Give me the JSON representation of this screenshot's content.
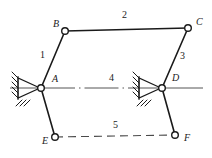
{
  "figure": {
    "width": 212,
    "height": 158,
    "background_color": "#ffffff",
    "line_color": "#1a1a1a",
    "label_color": "#1a1a1a"
  },
  "joints": [
    {
      "id": "A",
      "label": "A",
      "x": 41,
      "y": 88,
      "type": "fixed-pivot",
      "label_x": 52,
      "label_y": 74
    },
    {
      "id": "B",
      "label": "B",
      "x": 65,
      "y": 31,
      "type": "pin",
      "label_x": 53,
      "label_y": 19
    },
    {
      "id": "C",
      "label": "C",
      "x": 188,
      "y": 28,
      "type": "pin",
      "label_x": 196,
      "label_y": 17
    },
    {
      "id": "D",
      "label": "D",
      "x": 162,
      "y": 88,
      "type": "fixed-pivot",
      "label_x": 172,
      "label_y": 73
    },
    {
      "id": "E",
      "label": "E",
      "x": 55,
      "y": 137,
      "type": "pin",
      "label_x": 42,
      "label_y": 136
    },
    {
      "id": "F",
      "label": "F",
      "x": 175,
      "y": 135,
      "type": "pin",
      "label_x": 184,
      "label_y": 133
    }
  ],
  "links": [
    {
      "id": "1",
      "label": "1",
      "from": "A",
      "to": "B",
      "style": "solid",
      "label_x": 40,
      "label_y": 50
    },
    {
      "id": "2",
      "label": "2",
      "from": "B",
      "to": "C",
      "style": "solid",
      "label_x": 122,
      "label_y": 10
    },
    {
      "id": "3",
      "label": "3",
      "from": "C",
      "to": "D",
      "style": "solid",
      "label_x": 180,
      "label_y": 51
    },
    {
      "id": "4",
      "label": "4",
      "from": "A",
      "to": "D",
      "style": "dash-dot",
      "label_x": 109,
      "label_y": 73
    },
    {
      "id": "5",
      "label": "5",
      "from": "E",
      "to": "F",
      "style": "dashed",
      "label_x": 113,
      "label_y": 120
    }
  ],
  "segments": [
    {
      "id": "A-E",
      "from": "A",
      "to": "E",
      "style": "solid"
    },
    {
      "id": "D-F",
      "from": "D",
      "to": "F",
      "style": "solid"
    }
  ],
  "ground_axis": {
    "id": "ground-centerline",
    "style": "solid",
    "y": 88,
    "x_start": 10,
    "x_end": 203
  }
}
